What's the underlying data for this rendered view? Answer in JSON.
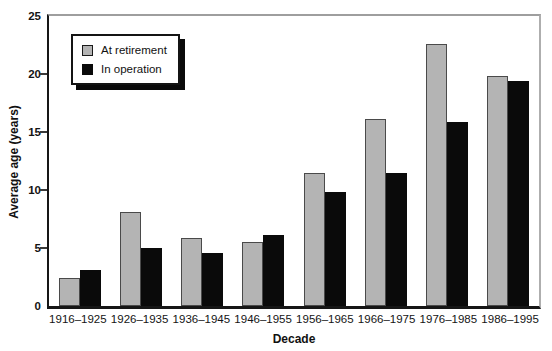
{
  "chart_data": {
    "type": "bar",
    "title": "",
    "categories": [
      "1916–1925",
      "1926–1935",
      "1936–1945",
      "1946–1955",
      "1956–1965",
      "1966–1975",
      "1976–1985",
      "1986–1995"
    ],
    "series": [
      {
        "name": "At retirement",
        "color": "#b4b4b4",
        "border": "#4a4a4a",
        "values": [
          2.4,
          8.1,
          5.9,
          5.5,
          11.5,
          16.1,
          22.6,
          19.8
        ]
      },
      {
        "name": "In operation",
        "color": "#0a0a0a",
        "border": "#0a0a0a",
        "values": [
          3.1,
          5.0,
          4.6,
          6.1,
          9.8,
          11.5,
          15.9,
          19.4
        ]
      }
    ],
    "xlabel": "Decade",
    "ylabel": "Average age (years)",
    "ylim": [
      0,
      25
    ],
    "yticks": [
      0,
      5,
      10,
      15,
      20,
      25
    ],
    "grid": false,
    "legend_position": "top-left-inside",
    "colors": {
      "axis": "#161616",
      "frame_gray": "#9e9e9e",
      "background": "#ffffff"
    }
  }
}
